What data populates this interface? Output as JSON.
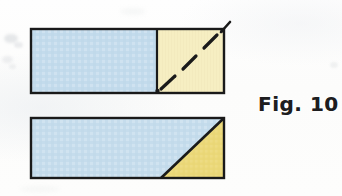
{
  "figure": {
    "caption": "Fig. 10",
    "colors": {
      "blue_fill": "#c3dbec",
      "blue_fill_bottom": "#c5dcec",
      "yellow_fill_top": "#f6eec2",
      "yellow_fill_bottom": "#ebd878",
      "outline": "#1a1a1a",
      "background": "#fdfdfd"
    },
    "shapes": [
      {
        "name": "top-rectangle",
        "label": "Rectangle split into blue rectangle and cream square",
        "x": 31,
        "y": 29,
        "width": 193,
        "height": 64,
        "parts": [
          {
            "name": "blue-rectangle-region",
            "fill": "#c3dbec",
            "points": "31,29 157,29 157,93 31,93"
          },
          {
            "name": "yellow-square-region",
            "fill": "#f6eec2",
            "points": "157,29 224,29 224,93 157,93"
          }
        ],
        "divider": {
          "name": "vertical-divider",
          "x1": 157,
          "y1": 29,
          "x2": 157,
          "y2": 93
        },
        "dashed_diagonal": {
          "name": "dashed-diagonal",
          "x1": 158,
          "y1": 92,
          "x2": 223,
          "y2": 30,
          "dash_count": 3,
          "style": "dashed"
        },
        "corner_tick": {
          "name": "corner-tick",
          "x1": 222,
          "y1": 31,
          "x2": 230,
          "y2": 22
        }
      },
      {
        "name": "bottom-rectangle",
        "label": "Rectangle split by diagonal into blue trapezoid and yellow triangle",
        "x": 31,
        "y": 118,
        "width": 193,
        "height": 60,
        "parts": [
          {
            "name": "blue-trapezoid-region",
            "fill": "#c5dcec",
            "points": "31,118 224,118 161,178 31,178"
          },
          {
            "name": "yellow-triangle-region",
            "fill": "#ebd878",
            "points": "224,118 224,178 161,178"
          }
        ],
        "diagonal": {
          "name": "diagonal-cut",
          "x1": 224,
          "y1": 118,
          "x2": 161,
          "y2": 178
        }
      }
    ]
  }
}
